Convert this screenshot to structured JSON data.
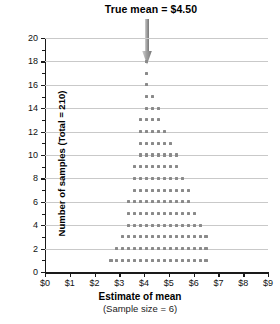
{
  "annotation": {
    "label": "True mean",
    "equals": "=",
    "value": "$4.50",
    "full": "True mean  =  $4.50"
  },
  "axes": {
    "y_title": "Number of samples (Total = 210)",
    "x_title": "Estimate of mean",
    "x_subtitle": "(Sample size = 6)",
    "y_ticks": [
      "0",
      "2",
      "4",
      "6",
      "8",
      "10",
      "12",
      "14",
      "16",
      "18",
      "20"
    ],
    "x_ticks": [
      "$0",
      "$1",
      "$2",
      "$3",
      "$4",
      "$5",
      "$6",
      "$7",
      "$8",
      "$9"
    ]
  },
  "colors": {
    "dot": "#8a8a8a",
    "gridline": "#c9c9c9",
    "axis": "#1a1a1a",
    "arrow": "#9b9b9b"
  },
  "chart_data": {
    "type": "scatter",
    "plot_style": "dot-plot (stacked dot histogram)",
    "title": "True mean  =  $4.50",
    "xlabel": "Estimate of mean (Sample size = 6)",
    "ylabel": "Number of samples (Total = 210)",
    "xlim": [
      0,
      9
    ],
    "ylim": [
      0,
      20
    ],
    "x_tick_step": 1,
    "y_tick_step": 2,
    "grid": "horizontal gridlines at even y values",
    "total_samples": 210,
    "true_mean": 4.5,
    "arrow_x": 4.1,
    "bin_width": 0.24,
    "annotations": [
      {
        "text": "True mean  =  $4.50",
        "x": 4.1,
        "y": 21.5,
        "arrow_to_y": 19
      }
    ],
    "bins": [
      {
        "x": 2.66,
        "count": 1
      },
      {
        "x": 2.9,
        "count": 2
      },
      {
        "x": 3.14,
        "count": 3
      },
      {
        "x": 3.38,
        "count": 6
      },
      {
        "x": 3.62,
        "count": 9
      },
      {
        "x": 3.86,
        "count": 13
      },
      {
        "x": 4.1,
        "count": 18
      },
      {
        "x": 4.34,
        "count": 15
      },
      {
        "x": 4.58,
        "count": 14
      },
      {
        "x": 4.82,
        "count": 12
      },
      {
        "x": 5.06,
        "count": 11
      },
      {
        "x": 5.3,
        "count": 10
      },
      {
        "x": 5.54,
        "count": 8
      },
      {
        "x": 5.78,
        "count": 7
      },
      {
        "x": 6.02,
        "count": 5
      },
      {
        "x": 6.26,
        "count": 4
      },
      {
        "x": 6.5,
        "count": 3
      }
    ],
    "rows": [
      {
        "y": 1,
        "dot_count": 17,
        "x_start": 2.66,
        "x_end": 6.5
      },
      {
        "y": 2,
        "dot_count": 16,
        "x_start": 2.9,
        "x_end": 6.5
      },
      {
        "y": 3,
        "dot_count": 16,
        "x_start": 2.9,
        "x_end": 6.5
      },
      {
        "y": 4,
        "dot_count": 14,
        "x_start": 3.14,
        "x_end": 6.26
      },
      {
        "y": 5,
        "dot_count": 13,
        "x_start": 3.14,
        "x_end": 6.02
      },
      {
        "y": 6,
        "dot_count": 13,
        "x_start": 3.14,
        "x_end": 6.02
      },
      {
        "y": 7,
        "dot_count": 12,
        "x_start": 3.38,
        "x_end": 6.02
      },
      {
        "y": 8,
        "dot_count": 12,
        "x_start": 3.38,
        "x_end": 6.02
      },
      {
        "y": 9,
        "dot_count": 11,
        "x_start": 3.38,
        "x_end": 5.78
      },
      {
        "y": 10,
        "dot_count": 11,
        "x_start": 3.38,
        "x_end": 5.78
      },
      {
        "y": 11,
        "dot_count": 9,
        "x_start": 3.62,
        "x_end": 5.54
      },
      {
        "y": 12,
        "dot_count": 8,
        "x_start": 3.62,
        "x_end": 5.3
      },
      {
        "y": 13,
        "dot_count": 7,
        "x_start": 3.62,
        "x_end": 5.06
      },
      {
        "y": 14,
        "dot_count": 6,
        "x_start": 3.86,
        "x_end": 5.06
      },
      {
        "y": 15,
        "dot_count": 5,
        "x_start": 3.86,
        "x_end": 4.82
      },
      {
        "y": 16,
        "dot_count": 5,
        "x_start": 3.86,
        "x_end": 4.82
      },
      {
        "y": 17,
        "dot_count": 1,
        "x_start": 4.1,
        "x_end": 4.1
      },
      {
        "y": 18,
        "dot_count": 1,
        "x_start": 4.1,
        "x_end": 4.1
      }
    ]
  }
}
